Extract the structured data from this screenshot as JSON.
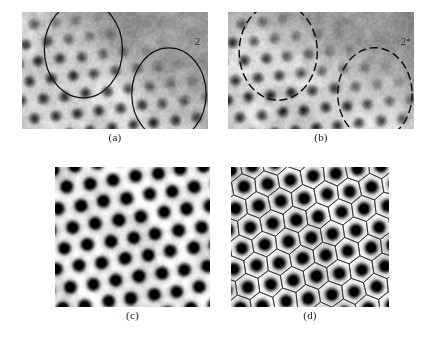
{
  "figure": {
    "background_color": "#ffffff",
    "panel_count": 4
  },
  "panels": [
    {
      "id": "a",
      "caption": "(a)",
      "description": "Grayscale atomic-resolution scan with two solid-outline circular markers highlighting defect sites",
      "image_type": "grayscale-micrograph",
      "lattice": "hexagonal",
      "overlay_style": "solid-circles",
      "markers": [
        {
          "label": "1",
          "shape": "circle",
          "stroke": "solid",
          "cx_pct": 33,
          "cy_pct": 32,
          "r_pct": 21
        },
        {
          "label": "2",
          "shape": "circle",
          "stroke": "solid",
          "cx_pct": 79,
          "cy_pct": 70,
          "r_pct": 20
        }
      ]
    },
    {
      "id": "b",
      "caption": "(b)",
      "description": "Grayscale atomic-resolution scan with two dashed-outline circular markers highlighting corresponding sites",
      "image_type": "grayscale-micrograph",
      "lattice": "hexagonal",
      "overlay_style": "dashed-circles",
      "markers": [
        {
          "label": "1",
          "shape": "circle",
          "stroke": "dashed",
          "cx_pct": 27,
          "cy_pct": 34,
          "r_pct": 21
        },
        {
          "label": "2*",
          "shape": "circle",
          "stroke": "dashed",
          "cx_pct": 79,
          "cy_pct": 70,
          "r_pct": 20
        }
      ]
    },
    {
      "id": "c",
      "caption": "(c)",
      "description": "High-contrast hexagonal lattice of dark spots, no overlay",
      "image_type": "grayscale-micrograph",
      "lattice": "hexagonal",
      "overlay_style": "none",
      "markers": []
    },
    {
      "id": "d",
      "caption": "(d)",
      "description": "Same lattice as panel c with hexagonal Voronoi tessellation overlay drawn over each spot",
      "image_type": "grayscale-micrograph",
      "lattice": "hexagonal",
      "overlay_style": "hexagonal-tessellation",
      "markers": []
    }
  ],
  "colors": {
    "page_background": "#ffffff",
    "marker_stroke": "#101010",
    "tessellation_stroke": "#2b2b2b",
    "caption_text": "#1a1a1a",
    "image_dark": "#1e1e1e",
    "image_mid": "#9a9a9a",
    "image_light": "#f0f0f0"
  }
}
